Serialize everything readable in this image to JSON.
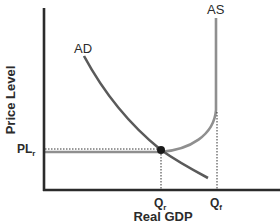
{
  "diagram": {
    "type": "aggregate-demand-aggregate-supply",
    "y_axis_label": "Price Level",
    "x_axis_label": "Real GDP",
    "curves": [
      {
        "name": "AD",
        "label": "AD",
        "color": "#5a5a5a"
      },
      {
        "name": "AS",
        "label": "AS",
        "color": "#8f8f8f"
      }
    ],
    "price_label": {
      "main": "PL",
      "sub": "r"
    },
    "x_ticks": [
      {
        "main": "Q",
        "sub": "r"
      },
      {
        "main": "Q",
        "sub": "f"
      }
    ],
    "equilibrium_point": {
      "price": "PLr",
      "quantity": "Qr"
    },
    "colors": {
      "axis": "#2b2b2b",
      "ad": "#5a5a5a",
      "as": "#8f8f8f",
      "dotted": "#333333",
      "point": "#1a1a1a"
    }
  }
}
